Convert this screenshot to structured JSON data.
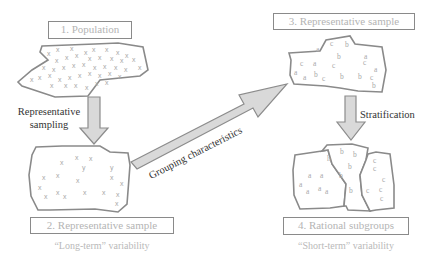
{
  "diagram": {
    "colors": {
      "outline": "#8a8a8a",
      "arrow_fill": "#d9d9d9",
      "arrow_stroke": "#8c8c8c",
      "label_text": "#b4b4b4",
      "marker_text": "#a8a8a8",
      "dark_text": "#333333"
    },
    "nodes": [
      {
        "id": "population",
        "label": "1. Population",
        "marker": "x"
      },
      {
        "id": "representative-sample-long",
        "label": "2. Representative sample",
        "marker": "x",
        "caption": "“Long-term” variability"
      },
      {
        "id": "representative-sample-grouped",
        "label": "3. Representative sample",
        "markers": [
          "a",
          "b",
          "c"
        ]
      },
      {
        "id": "rational-subgroups",
        "label": "4. Rational subgroups",
        "markers": [
          "a",
          "b",
          "c"
        ],
        "caption": "“Short-term” variability"
      }
    ],
    "edges": [
      {
        "from": "population",
        "to": "representative-sample-long",
        "label_line1": "Representative",
        "label_line2": "sampling"
      },
      {
        "from": "representative-sample-long",
        "to": "representative-sample-grouped",
        "label": "Grouping characteristics"
      },
      {
        "from": "representative-sample-grouped",
        "to": "rational-subgroups",
        "label": "Stratification"
      }
    ]
  }
}
